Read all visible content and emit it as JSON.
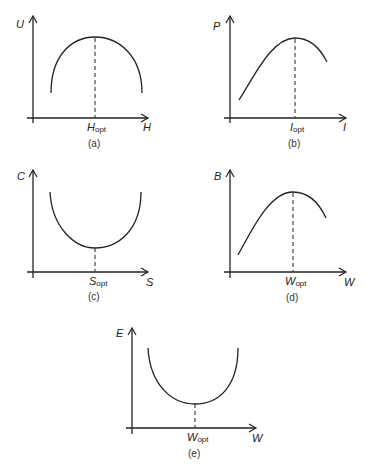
{
  "panels": [
    {
      "id": "a",
      "caption": "(a)",
      "y_label": "U",
      "x_label": "H",
      "opt_label_main": "H",
      "opt_label_sub": "opt",
      "shape": "maximum (inverted U)"
    },
    {
      "id": "b",
      "caption": "(b)",
      "y_label": "P",
      "x_label": "I",
      "opt_label_main": "I",
      "opt_label_sub": "opt",
      "shape": "maximum (skewed hump)"
    },
    {
      "id": "c",
      "caption": "(c)",
      "y_label": "C",
      "x_label": "S",
      "opt_label_main": "S",
      "opt_label_sub": "opt",
      "shape": "minimum (U)"
    },
    {
      "id": "d",
      "caption": "(d)",
      "y_label": "B",
      "x_label": "W",
      "opt_label_main": "W",
      "opt_label_sub": "opt",
      "shape": "maximum (skewed hump)"
    },
    {
      "id": "e",
      "caption": "(e)",
      "y_label": "E",
      "x_label": "W",
      "opt_label_main": "W",
      "opt_label_sub": "opt",
      "shape": "minimum (U)"
    }
  ],
  "colors": {
    "line": "#222222",
    "background": "#ffffff"
  }
}
